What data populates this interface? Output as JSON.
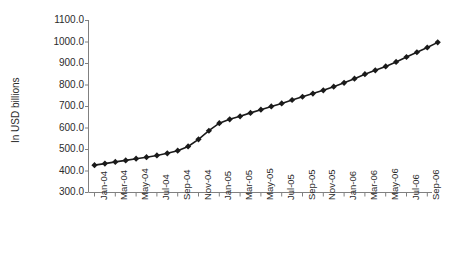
{
  "chart_data": {
    "type": "line",
    "title": "",
    "xlabel": "",
    "ylabel": "In USD billions",
    "ylim": [
      300.0,
      1100.0
    ],
    "ytick_step": 100.0,
    "ytick_labels": [
      "1100.0",
      "1000.0",
      "900.0",
      "800.0",
      "700.0",
      "600.0",
      "500.0",
      "400.0",
      "300.0"
    ],
    "ytick_values": [
      1100.0,
      1000.0,
      900.0,
      800.0,
      700.0,
      600.0,
      500.0,
      400.0,
      300.0
    ],
    "grid": false,
    "legend": "none",
    "marker": "diamond",
    "line_color": "#1a1a1a",
    "marker_color": "#1a1a1a",
    "axis_color": "#808080",
    "tick_label_interval_months": 2,
    "categories": [
      "Jan-04",
      "Feb-04",
      "Mar-04",
      "Apr-04",
      "May-04",
      "Jun-04",
      "Jul-04",
      "Aug-04",
      "Sep-04",
      "Oct-04",
      "Nov-04",
      "Dec-04",
      "Jan-05",
      "Feb-05",
      "Mar-05",
      "Apr-05",
      "May-05",
      "Jun-05",
      "Jul-05",
      "Aug-05",
      "Sep-05",
      "Oct-05",
      "Nov-05",
      "Dec-05",
      "Jan-06",
      "Feb-06",
      "Mar-06",
      "Apr-06",
      "May-06",
      "Jun-06",
      "Jul-06",
      "Aug-06",
      "Sep-06",
      "Oct-06"
    ],
    "xtick_labels": [
      "Jan-04",
      "Mar-04",
      "May-04",
      "Jul-04",
      "Sep-04",
      "Nov-04",
      "Jan-05",
      "Mar-05",
      "May-05",
      "Jul-05",
      "Sep-05",
      "Nov-05",
      "Jan-06",
      "Mar-06",
      "May-06",
      "Jul-06",
      "Sep-06"
    ],
    "values": [
      425,
      432,
      440,
      447,
      455,
      462,
      470,
      480,
      492,
      512,
      545,
      585,
      620,
      638,
      652,
      668,
      683,
      698,
      712,
      728,
      743,
      758,
      773,
      790,
      808,
      827,
      848,
      866,
      884,
      905,
      928,
      950,
      972,
      996
    ]
  }
}
